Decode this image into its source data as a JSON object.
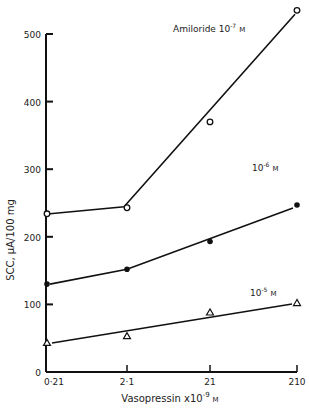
{
  "chart_data": {
    "type": "line",
    "title": "",
    "xlabel": "Vasopressin x10^-9 M",
    "xlabel_parts": {
      "base": "Vasopressin  x10",
      "exp": "-9",
      "unit": "M"
    },
    "ylabel": "SCC,  μA/100 mg",
    "x_scale": "log",
    "categories": [
      "0·21",
      "2·1",
      "21",
      "210"
    ],
    "x": [
      0.21,
      2.1,
      21,
      210
    ],
    "ylim": [
      0,
      500
    ],
    "yticks": [
      0,
      100,
      200,
      300,
      400,
      500
    ],
    "grid": false,
    "legend_position": "inline labels near lines",
    "series": [
      {
        "name": "Amiloride 10^-7 M",
        "label_base": "Amiloride  10",
        "label_exp": "-7",
        "label_unit": "M",
        "marker": "open-circle",
        "values": [
          234,
          243,
          370,
          535
        ]
      },
      {
        "name": "10^-6 M",
        "label_base": "10",
        "label_exp": "-6",
        "label_unit": "M",
        "marker": "filled-circle",
        "values": [
          130,
          152,
          193,
          247
        ]
      },
      {
        "name": "10^-5 M",
        "label_base": "10",
        "label_exp": "-5",
        "label_unit": "M",
        "marker": "open-triangle",
        "values": [
          43,
          53,
          88,
          102
        ]
      }
    ]
  }
}
